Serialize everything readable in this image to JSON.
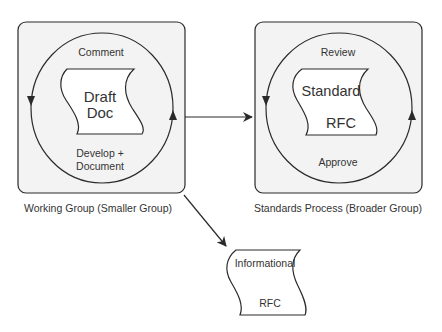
{
  "diagram": {
    "colors": {
      "stroke": "#2a2a2a",
      "panel_fill": "#f3f3f3",
      "text": "#333333",
      "background": "#ffffff"
    },
    "working_group": {
      "caption": "Working Group (Smaller Group)",
      "cycle_top": "Comment",
      "cycle_bottom_line1": "Develop +",
      "cycle_bottom_line2": "Document",
      "document": {
        "line1": "Draft",
        "line2": "Doc"
      }
    },
    "standards_process": {
      "caption": "Standards Process (Broader Group)",
      "cycle_top": "Review",
      "cycle_bottom": "Approve",
      "document": {
        "line1": "Standard",
        "line2": "RFC"
      }
    },
    "informational": {
      "document": {
        "line1": "Informational",
        "line2": "RFC"
      }
    },
    "edges": [
      {
        "from": "working_group",
        "to": "standards_process"
      },
      {
        "from": "working_group",
        "to": "informational"
      }
    ]
  }
}
